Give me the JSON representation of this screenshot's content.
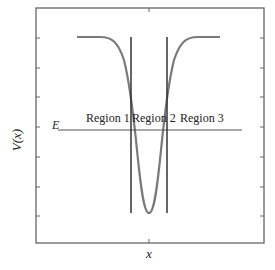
{
  "diagram": {
    "type": "potential-well",
    "y_axis_label": "V(x)",
    "x_axis_label": "x",
    "energy_label": "E",
    "regions": [
      {
        "label": "Region 1"
      },
      {
        "label": "Region 2"
      },
      {
        "label": "Region 3"
      }
    ],
    "colors": {
      "frame": "#555555",
      "curve": "#7a7a7a",
      "lines": "#333333",
      "text": "#222222"
    }
  }
}
